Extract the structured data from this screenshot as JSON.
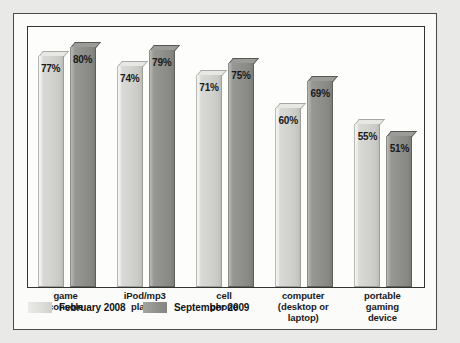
{
  "chart_data": {
    "type": "bar",
    "title": "",
    "subtitle": "",
    "xlabel": "",
    "ylabel": "",
    "ylim": [
      0,
      100
    ],
    "grid": false,
    "legend_position": "bottom-left",
    "categories": [
      "game\nconsole",
      "iPod/mp3\nplayer",
      "cell\nphone",
      "computer\n(desktop or\nlaptop)",
      "portable\ngaming\ndevice"
    ],
    "category_lines": [
      [
        "game",
        "console"
      ],
      [
        "iPod/mp3",
        "player"
      ],
      [
        "cell",
        "phone"
      ],
      [
        "computer",
        "(desktop or",
        "laptop)"
      ],
      [
        "portable",
        "gaming",
        "device"
      ]
    ],
    "series": [
      {
        "name": "February 2008",
        "color": "#d8d8d5",
        "values": [
          77,
          74,
          71,
          60,
          55
        ],
        "labels": [
          "77%",
          "74%",
          "71%",
          "60%",
          "55%"
        ]
      },
      {
        "name": "September 2009",
        "color": "#909090",
        "values": [
          80,
          79,
          75,
          69,
          51
        ],
        "labels": [
          "80%",
          "79%",
          "75%",
          "69%",
          "51%"
        ]
      }
    ]
  },
  "legend": {
    "items": [
      {
        "label": "February 2008",
        "swatch": "light"
      },
      {
        "label": "September 2009",
        "swatch": "dark"
      }
    ]
  },
  "colors": {
    "page_background": "#e9e9e7",
    "figure_background": "#fbfbfa",
    "plot_background": "#fdfdfc",
    "frame_border": "#4a4a4a",
    "axis_border": "#333333",
    "series_light": "#d8d8d5",
    "series_dark": "#909090",
    "label_text": "#1a1a1a"
  }
}
